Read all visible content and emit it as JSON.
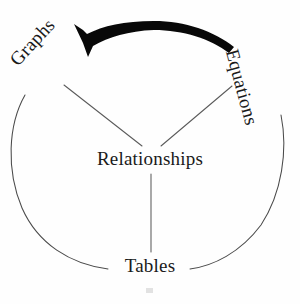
{
  "diagram": {
    "title": "Relationships",
    "type": "cycle-concept-map",
    "background_color": "#fefefe",
    "ink_color": "#1a1a1a",
    "arrow_color": "#080808",
    "arc_color": "#4a4a4a",
    "center_node": {
      "id": "relationships",
      "label": "Relationships",
      "x": 151,
      "y": 158
    },
    "ring_nodes": [
      {
        "id": "graphs",
        "label": "Graphs",
        "x": 45,
        "y": 68,
        "rotation_deg": -47
      },
      {
        "id": "equations",
        "label": "Equations",
        "x": 254,
        "y": 75,
        "rotation_deg": 75
      },
      {
        "id": "tables",
        "label": "Tables",
        "x": 151,
        "y": 266,
        "rotation_deg": 0
      }
    ],
    "spokes": [
      {
        "from": "graphs",
        "to": "relationships"
      },
      {
        "from": "equations",
        "to": "relationships"
      },
      {
        "from": "relationships",
        "to": "tables"
      }
    ],
    "flow_arrow": {
      "from": "equations",
      "to": "graphs",
      "direction": "counterclockwise",
      "style": "thick-tapered-curve",
      "head": "solid-triangle"
    },
    "ring": {
      "center_x": 151,
      "center_y": 155,
      "radius": 128,
      "style": "thin-open-circle",
      "gaps_at": [
        "graphs",
        "equations",
        "tables"
      ]
    }
  }
}
